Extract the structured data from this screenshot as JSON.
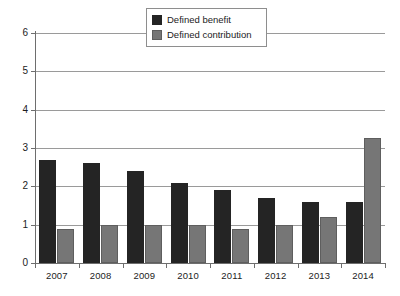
{
  "chart_data": {
    "type": "bar",
    "title": "",
    "subtitle": "",
    "xlabel": "",
    "ylabel": "",
    "categories": [
      "2007",
      "2008",
      "2009",
      "2010",
      "2011",
      "2012",
      "2013",
      "2014"
    ],
    "series": [
      {
        "name": "Defined benefit",
        "color": "#242424",
        "values": [
          2.7,
          2.6,
          2.4,
          2.1,
          1.9,
          1.7,
          1.6,
          1.6
        ]
      },
      {
        "name": "Defined contribution",
        "color": "#767676",
        "values": [
          0.9,
          1.0,
          1.0,
          1.0,
          0.9,
          1.0,
          1.2,
          3.25
        ]
      }
    ],
    "ylim": [
      0,
      6
    ],
    "ytick_values": [
      0,
      1,
      2,
      3,
      4,
      5,
      6
    ],
    "ytick_labels": [
      "0",
      "1",
      "2",
      "3",
      "4",
      "5",
      "6"
    ],
    "grid": true,
    "grid_axis": "y",
    "legend_position": "top-center",
    "legend_entries": [
      "Defined benefit",
      "Defined contribution"
    ],
    "annotations": []
  }
}
